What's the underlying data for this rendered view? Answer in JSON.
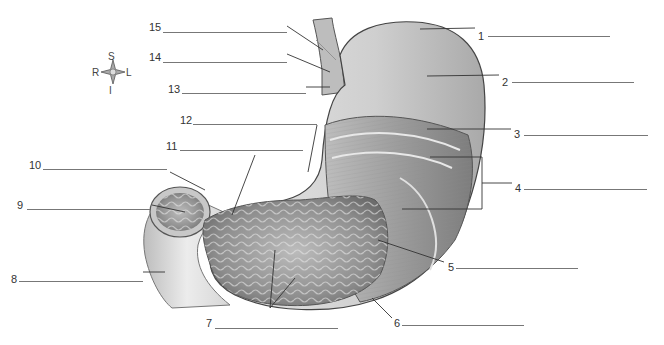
{
  "diagram": {
    "compass": {
      "superior": "S",
      "inferior": "I",
      "right": "R",
      "left": "L"
    },
    "labels": [
      {
        "num": "1",
        "x": 478,
        "y": 31,
        "line": [
          488,
          36,
          610
        ]
      },
      {
        "num": "2",
        "x": 502,
        "y": 77,
        "line": [
          512,
          82,
          634
        ]
      },
      {
        "num": "3",
        "x": 514,
        "y": 129,
        "line": [
          524,
          135,
          648
        ]
      },
      {
        "num": "4",
        "x": 515,
        "y": 183,
        "line": [
          524,
          189,
          647
        ]
      },
      {
        "num": "5",
        "x": 448,
        "y": 262,
        "line": [
          456,
          268,
          578
        ]
      },
      {
        "num": "6",
        "x": 394,
        "y": 318,
        "line": [
          402,
          325,
          524
        ]
      },
      {
        "num": "7",
        "x": 206,
        "y": 318,
        "line": [
          215,
          328,
          338
        ]
      },
      {
        "num": "8",
        "x": 11,
        "y": 274,
        "line": [
          19,
          281,
          143
        ]
      },
      {
        "num": "9",
        "x": 17,
        "y": 200,
        "line": [
          27,
          209,
          150
        ]
      },
      {
        "num": "10",
        "x": 29,
        "y": 160,
        "line": [
          43,
          169,
          167
        ]
      },
      {
        "num": "11",
        "x": 166,
        "y": 141,
        "line": [
          180,
          150,
          303
        ]
      },
      {
        "num": "12",
        "x": 180,
        "y": 115,
        "line": [
          193,
          124,
          317
        ]
      },
      {
        "num": "13",
        "x": 168,
        "y": 84,
        "line": [
          182,
          93,
          306
        ]
      },
      {
        "num": "14",
        "x": 149,
        "y": 52,
        "line": [
          163,
          62,
          287
        ]
      },
      {
        "num": "15",
        "x": 149,
        "y": 22,
        "line": [
          163,
          32,
          287
        ]
      }
    ]
  }
}
